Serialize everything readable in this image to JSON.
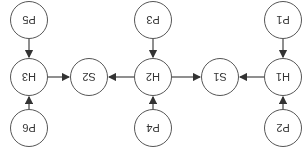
{
  "orientation": "rotated 180 degrees",
  "nodes": [
    {
      "id": "P1",
      "label": "P1",
      "x": 23,
      "y": 135
    },
    {
      "id": "P2",
      "label": "P2",
      "x": 23,
      "y": 27
    },
    {
      "id": "H1",
      "label": "H1",
      "x": 23,
      "y": 78
    },
    {
      "id": "S1",
      "label": "S1",
      "x": 86,
      "y": 78
    },
    {
      "id": "P3",
      "label": "P3",
      "x": 153,
      "y": 135
    },
    {
      "id": "P4",
      "label": "P4",
      "x": 153,
      "y": 27
    },
    {
      "id": "H2",
      "label": "H2",
      "x": 153,
      "y": 78
    },
    {
      "id": "S2",
      "label": "S2",
      "x": 217,
      "y": 78
    },
    {
      "id": "P5",
      "label": "P5",
      "x": 277,
      "y": 135
    },
    {
      "id": "P6",
      "label": "P6",
      "x": 277,
      "y": 27
    },
    {
      "id": "H3",
      "label": "H3",
      "x": 277,
      "y": 78
    }
  ],
  "edges": [
    {
      "from": "P1",
      "to": "H1"
    },
    {
      "from": "P2",
      "to": "H1"
    },
    {
      "from": "H1",
      "to": "S1"
    },
    {
      "from": "P3",
      "to": "H2"
    },
    {
      "from": "P4",
      "to": "H2"
    },
    {
      "from": "H2",
      "to": "S1"
    },
    {
      "from": "H2",
      "to": "S2"
    },
    {
      "from": "P5",
      "to": "H3"
    },
    {
      "from": "P6",
      "to": "H3"
    },
    {
      "from": "H3",
      "to": "S2"
    }
  ]
}
